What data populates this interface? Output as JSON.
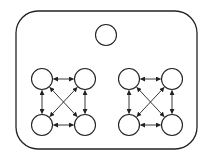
{
  "diagram": {
    "stroke_color": "#222222",
    "background": "#ffffff",
    "container": {
      "x": 16,
      "y": 11,
      "width": 181,
      "height": 138,
      "radius": 22
    },
    "top_node": {
      "cx": 106,
      "cy": 35,
      "r": 10.5
    },
    "groups": [
      {
        "name": "left-cluster",
        "nodes": [
          {
            "id": "tl",
            "cx": 42,
            "cy": 79
          },
          {
            "id": "tr",
            "cx": 85,
            "cy": 79
          },
          {
            "id": "bl",
            "cx": 42,
            "cy": 125
          },
          {
            "id": "br",
            "cx": 85,
            "cy": 125
          }
        ]
      },
      {
        "name": "right-cluster",
        "nodes": [
          {
            "id": "tl",
            "cx": 129,
            "cy": 79
          },
          {
            "id": "tr",
            "cx": 172,
            "cy": 79
          },
          {
            "id": "bl",
            "cx": 129,
            "cy": 125
          },
          {
            "id": "br",
            "cx": 172,
            "cy": 125
          }
        ]
      }
    ],
    "node_radius": 10.5,
    "edges": [
      [
        "tl",
        "tr"
      ],
      [
        "bl",
        "br"
      ],
      [
        "tl",
        "bl"
      ],
      [
        "tr",
        "br"
      ],
      [
        "tl",
        "br"
      ],
      [
        "tr",
        "bl"
      ]
    ],
    "edge_type": "bidirectional-arrow"
  }
}
